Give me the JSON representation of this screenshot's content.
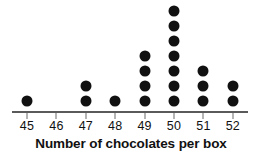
{
  "chart_data": {
    "type": "dot-plot",
    "title": "",
    "xlabel": "Number of chocolates per box",
    "ylabel": "",
    "categories": [
      "45",
      "46",
      "47",
      "48",
      "49",
      "50",
      "51",
      "52"
    ],
    "values": [
      1,
      0,
      2,
      1,
      4,
      7,
      3,
      2
    ],
    "tick_labels": [
      "45",
      "46",
      "47",
      "48",
      "49",
      "50",
      "51",
      "52"
    ],
    "xlim": [
      45,
      52
    ],
    "ylim": [
      0,
      7
    ],
    "grid": false,
    "legend": null,
    "total_count": 20,
    "dot_color": "#111111",
    "axis_color": "#5a5a5a"
  },
  "axis": {
    "caption": "Number of chocolates per box"
  }
}
